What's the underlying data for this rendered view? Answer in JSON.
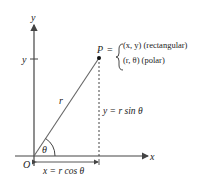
{
  "diagram": {
    "axes": {
      "x_label": "x",
      "y_label": "y",
      "origin_label": "O",
      "y_tick_label": "y"
    },
    "point": {
      "label": "P",
      "equals": "=",
      "rect": "(x, y) (rectangular)",
      "polar": "(r, θ) (polar)"
    },
    "radius_label": "r",
    "angle_label": "θ",
    "vertical_label": "y = r sin θ",
    "horizontal_label": "x = r cos θ",
    "colors": {
      "line": "#444444",
      "text": "#222222",
      "point": "#111111"
    }
  }
}
